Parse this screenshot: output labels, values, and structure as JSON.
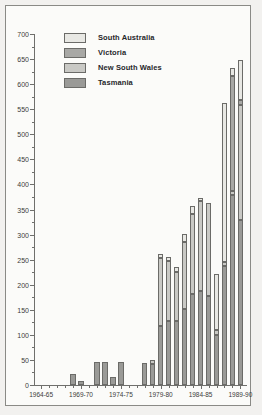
{
  "chart_data": {
    "type": "bar",
    "subtype": "stacked-vertical",
    "title": "",
    "xlabel": "",
    "ylabel": "",
    "ylim": [
      0,
      700
    ],
    "ytick_step": 50,
    "yminor_step": 25,
    "grid": false,
    "legend_position": "top-left",
    "ytick_labels": [
      "0",
      "50",
      "100",
      "150",
      "200",
      "250",
      "300",
      "350",
      "400",
      "450",
      "500",
      "550",
      "600",
      "650",
      "700"
    ],
    "xtick_labels": [
      "1964-65",
      "1969-70",
      "1974-75",
      "1979-80",
      "1984-85",
      "1989-90"
    ],
    "categories": [
      "1964-65",
      "1965-66",
      "1966-67",
      "1967-68",
      "1968-69",
      "1969-70",
      "1970-71",
      "1971-72",
      "1972-73",
      "1973-74",
      "1974-75",
      "1975-76",
      "1976-77",
      "1977-78",
      "1978-79",
      "1979-80",
      "1980-81",
      "1981-82",
      "1982-83",
      "1983-84",
      "1984-85",
      "1985-86",
      "1986-87",
      "1987-88",
      "1988-89",
      "1989-90"
    ],
    "series": [
      {
        "name": "Tasmania",
        "color": "#9a9a97",
        "values": [
          0,
          0,
          0,
          0,
          22,
          8,
          0,
          46,
          46,
          16,
          46,
          0,
          0,
          43,
          41,
          118,
          128,
          128,
          152,
          181,
          188,
          178,
          100,
          237,
          378,
          330
        ]
      },
      {
        "name": "New South Wales",
        "color": "#c9c9c5",
        "values": [
          0,
          0,
          0,
          0,
          0,
          0,
          0,
          0,
          0,
          0,
          0,
          0,
          0,
          0,
          8,
          135,
          120,
          98,
          134,
          160,
          178,
          185,
          10,
          8,
          8,
          228
        ]
      },
      {
        "name": "Victoria",
        "color": "#a8a8a5",
        "values": [
          0,
          0,
          0,
          0,
          0,
          0,
          0,
          0,
          0,
          0,
          0,
          0,
          0,
          0,
          0,
          0,
          0,
          0,
          0,
          0,
          0,
          0,
          0,
          0,
          230,
          10
        ]
      },
      {
        "name": "South Australia",
        "color": "#e8e8e4",
        "values": [
          0,
          0,
          0,
          0,
          0,
          0,
          0,
          0,
          0,
          0,
          0,
          0,
          0,
          0,
          0,
          8,
          8,
          10,
          15,
          17,
          6,
          0,
          112,
          317,
          16,
          80
        ]
      }
    ],
    "totals": [
      0,
      0,
      0,
      0,
      22,
      8,
      0,
      46,
      46,
      16,
      46,
      0,
      0,
      43,
      49,
      261,
      256,
      236,
      301,
      358,
      372,
      363,
      222,
      562,
      632,
      648
    ]
  },
  "legend": {
    "items": [
      {
        "label": "South Australia",
        "color": "#e8e8e4"
      },
      {
        "label": "Victoria",
        "color": "#a8a8a5"
      },
      {
        "label": "New South Wales",
        "color": "#c9c9c5"
      },
      {
        "label": "Tasmania",
        "color": "#9a9a97"
      }
    ]
  }
}
